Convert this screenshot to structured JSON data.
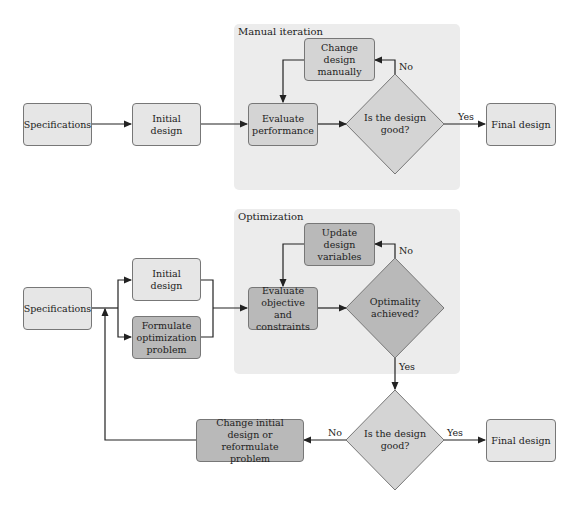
{
  "top_flow": {
    "region_label": "Manual iteration",
    "nodes": {
      "specifications": "Specifications",
      "initial_design": "Initial design",
      "evaluate": "Evaluate performance",
      "change_design": "Change design manually",
      "decision": "Is the design good?",
      "final_design": "Final design"
    },
    "edges": {
      "no": "No",
      "yes": "Yes"
    }
  },
  "bottom_flow": {
    "region_label": "Optimization",
    "nodes": {
      "specifications": "Specifications",
      "initial_design": "Initial design",
      "formulate": "Formulate optimization problem",
      "evaluate": "Evaluate objective and constraints",
      "update": "Update design variables",
      "optimality": "Optimality achieved?",
      "decision": "Is the design good?",
      "change_initial": "Change initial design or reformulate problem",
      "final_design": "Final design"
    },
    "edges": {
      "opt_no": "No",
      "opt_yes": "Yes",
      "dec_no": "No",
      "dec_yes": "Yes"
    }
  },
  "colors": {
    "region": "#ececec",
    "box_light": "#e6e6e6",
    "box_mid": "#d4d4d4",
    "box_dark": "#b9b9b9",
    "border": "#777777",
    "line": "#222222"
  }
}
